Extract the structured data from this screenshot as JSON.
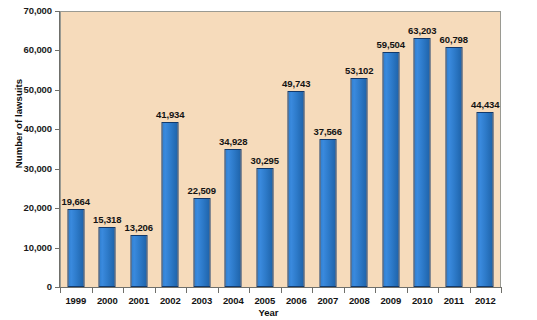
{
  "chart_data": {
    "type": "bar",
    "title": "",
    "xlabel": "Year",
    "ylabel": "Number of lawsuits",
    "categories": [
      "1999",
      "2000",
      "2001",
      "2002",
      "2003",
      "2004",
      "2005",
      "2006",
      "2007",
      "2008",
      "2009",
      "2010",
      "2011",
      "2012"
    ],
    "values": [
      19664,
      15318,
      13206,
      41934,
      22509,
      34928,
      30295,
      49743,
      37566,
      53102,
      59504,
      63203,
      60798,
      44434
    ],
    "value_labels": [
      "19,664",
      "15,318",
      "13,206",
      "41,934",
      "22,509",
      "34,928",
      "30,295",
      "49,743",
      "37,566",
      "53,102",
      "59,504",
      "63,203",
      "60,798",
      "44,434"
    ],
    "ylim": [
      0,
      70000
    ],
    "ytick_values": [
      0,
      10000,
      20000,
      30000,
      40000,
      50000,
      60000,
      70000
    ],
    "ytick_labels": [
      "0",
      "10,000",
      "20,000",
      "30,000",
      "40,000",
      "50,000",
      "60,000",
      "70,000"
    ],
    "grid": false,
    "legend": false,
    "colors": {
      "bar_fill": "#2f7fd0",
      "bar_outline": "#12396b",
      "plot_background": "#f6dbbb",
      "axis_line": "#6f6f6a",
      "text": "#131313",
      "page_background": "#ffffff"
    }
  }
}
